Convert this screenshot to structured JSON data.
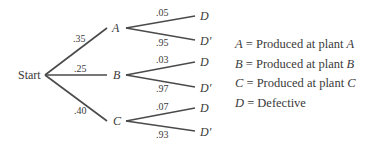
{
  "tree": {
    "root": "Start",
    "first_level": [
      {
        "node": "A",
        "prob": ".35",
        "children": [
          {
            "node": "D",
            "prob": ".05"
          },
          {
            "node": "D′",
            "prob": ".95"
          }
        ]
      },
      {
        "node": "B",
        "prob": ".25",
        "children": [
          {
            "node": "D",
            "prob": ".03"
          },
          {
            "node": "D′",
            "prob": ".97"
          }
        ]
      },
      {
        "node": "C",
        "prob": ".40",
        "children": [
          {
            "node": "D",
            "prob": ".07"
          },
          {
            "node": "D′",
            "prob": ".93"
          }
        ]
      }
    ]
  },
  "legend": [
    {
      "symbol": "A",
      "eq": " = Produced at plant ",
      "ref": "A"
    },
    {
      "symbol": "B",
      "eq": " = Produced at plant ",
      "ref": "B"
    },
    {
      "symbol": "C",
      "eq": " = Produced at plant ",
      "ref": "C"
    },
    {
      "symbol": "D",
      "eq": " = Defective",
      "ref": ""
    }
  ],
  "colors": {
    "line": "#4a4a4a",
    "text": "#3a3a3a"
  }
}
